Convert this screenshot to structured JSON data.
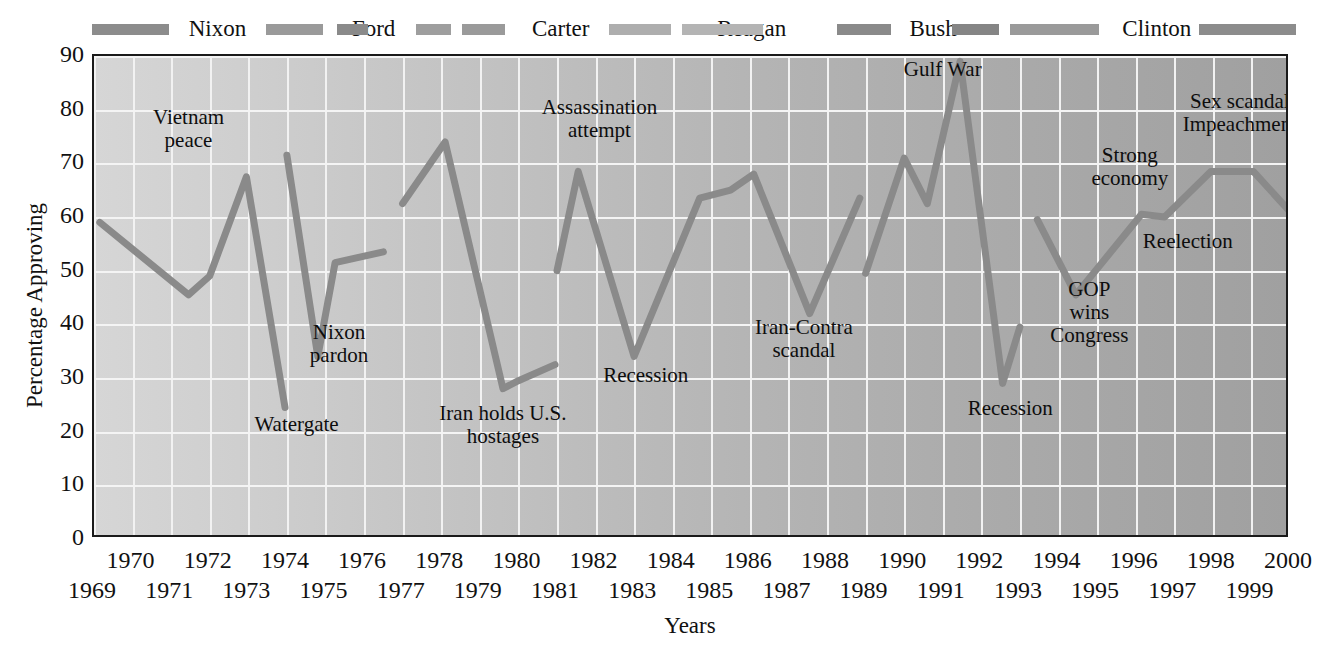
{
  "chart_data": {
    "type": "line",
    "title": "",
    "xlabel": "Years",
    "ylabel": "Percentage Approving",
    "ylim": [
      0,
      90
    ],
    "ytick_step": 10,
    "yticks": [
      "0",
      "10",
      "20",
      "30",
      "40",
      "50",
      "60",
      "70",
      "80",
      "90"
    ],
    "xlim": [
      1969,
      2000
    ],
    "grid": true,
    "legend_position": "top",
    "xticks_upper": [
      "1970",
      "1972",
      "1974",
      "1976",
      "1978",
      "1980",
      "1982",
      "1984",
      "1986",
      "1988",
      "1990",
      "1992",
      "1994",
      "1996",
      "1998",
      "2000"
    ],
    "xticks_lower": [
      "1969",
      "1971",
      "1973",
      "1975",
      "1977",
      "1979",
      "1981",
      "1983",
      "1985",
      "1987",
      "1989",
      "1991",
      "1993",
      "1995",
      "1997",
      "1999"
    ],
    "line_color": "#8a8a8a",
    "series": [
      {
        "name": "Nixon",
        "points": [
          {
            "x": 1969.15,
            "y": 59
          },
          {
            "x": 1971.45,
            "y": 45.5
          },
          {
            "x": 1972.0,
            "y": 49
          },
          {
            "x": 1972.95,
            "y": 67.5
          },
          {
            "x": 1973.95,
            "y": 24.5
          }
        ]
      },
      {
        "name": "Ford",
        "points": [
          {
            "x": 1974.0,
            "y": 71.5
          },
          {
            "x": 1974.8,
            "y": 34
          },
          {
            "x": 1975.25,
            "y": 51.5
          },
          {
            "x": 1976.5,
            "y": 53.5
          }
        ]
      },
      {
        "name": "Carter",
        "points": [
          {
            "x": 1977.0,
            "y": 62.5
          },
          {
            "x": 1978.1,
            "y": 74
          },
          {
            "x": 1979.6,
            "y": 28
          },
          {
            "x": 1980.0,
            "y": 29.5
          },
          {
            "x": 1980.95,
            "y": 32.5
          }
        ]
      },
      {
        "name": "Reagan",
        "points": [
          {
            "x": 1981.0,
            "y": 50
          },
          {
            "x": 1981.55,
            "y": 68.5
          },
          {
            "x": 1983.0,
            "y": 34
          },
          {
            "x": 1984.7,
            "y": 63.5
          },
          {
            "x": 1985.5,
            "y": 65
          },
          {
            "x": 1986.1,
            "y": 68
          },
          {
            "x": 1987.55,
            "y": 42
          },
          {
            "x": 1988.85,
            "y": 63.5
          }
        ]
      },
      {
        "name": "Bush",
        "points": [
          {
            "x": 1989.0,
            "y": 49.5
          },
          {
            "x": 1990.0,
            "y": 71
          },
          {
            "x": 1990.6,
            "y": 62.5
          },
          {
            "x": 1991.45,
            "y": 89
          },
          {
            "x": 1992.55,
            "y": 29
          },
          {
            "x": 1993.0,
            "y": 39.5
          }
        ]
      },
      {
        "name": "Clinton",
        "points": [
          {
            "x": 1993.45,
            "y": 59.5
          },
          {
            "x": 1994.45,
            "y": 45.5
          },
          {
            "x": 1996.15,
            "y": 60.5
          },
          {
            "x": 1996.75,
            "y": 60
          },
          {
            "x": 1997.95,
            "y": 68.5
          },
          {
            "x": 1999.05,
            "y": 68.5
          },
          {
            "x": 2000.0,
            "y": 61
          }
        ]
      }
    ],
    "annotations": [
      {
        "text": "Vietnam\npeace",
        "x": 1971.45,
        "y": 76.5
      },
      {
        "text": "Watergate",
        "x": 1974.25,
        "y": 21.5
      },
      {
        "text": "Nixon\npardon",
        "x": 1975.35,
        "y": 36.5
      },
      {
        "text": "Iran holds U.S.\nhostages",
        "x": 1979.6,
        "y": 21.5
      },
      {
        "text": "Assassination\nattempt",
        "x": 1982.1,
        "y": 78.5
      },
      {
        "text": "Recession",
        "x": 1983.3,
        "y": 30.5
      },
      {
        "text": "Iran-Contra\nscandal",
        "x": 1987.4,
        "y": 37.5
      },
      {
        "text": "Gulf War",
        "x": 1991.0,
        "y": 87.5
      },
      {
        "text": "Recession",
        "x": 1992.75,
        "y": 24.5
      },
      {
        "text": "GOP\nwins\nCongress",
        "x": 1994.8,
        "y": 42.5
      },
      {
        "text": "Strong\neconomy",
        "x": 1995.85,
        "y": 69.5
      },
      {
        "text": "Reelection",
        "x": 1997.35,
        "y": 55.5
      },
      {
        "text": "Sex scandal\nImpeachment",
        "x": 1998.7,
        "y": 79.5
      }
    ],
    "legend_segments": [
      {
        "label": "Nixon",
        "bar_start": 1969.0,
        "bar_end": 1971.0,
        "label_x": 1972.25,
        "color": "#8c8c8c"
      },
      {
        "label": "Ford",
        "bar_start": 1973.5,
        "bar_end": 1975.0,
        "label_x": 1976.3,
        "color": "#9a9a9a"
      },
      {
        "label": "Ford2",
        "bar_start": 1975.35,
        "bar_end": 1976.15,
        "label_x": null,
        "color": "#8a8a8a"
      },
      {
        "label": "Carter",
        "bar_start": 1977.4,
        "bar_end": 1978.3,
        "label_x": 1981.15,
        "color": "#9e9e9e"
      },
      {
        "label": "Carter2",
        "bar_start": 1978.6,
        "bar_end": 1979.7,
        "label_x": null,
        "color": "#9a9a9a"
      },
      {
        "label": "Reagan",
        "bar_start": 1982.4,
        "bar_end": 1984.0,
        "label_x": 1986.1,
        "color": "#aeaeae"
      },
      {
        "label": "Reagan2",
        "bar_start": 1984.3,
        "bar_end": 1986.4,
        "label_x": null,
        "color": "#b4b4b4"
      },
      {
        "label": "Bush",
        "bar_start": 1988.3,
        "bar_end": 1989.7,
        "label_x": 1990.8,
        "color": "#8a8a8a"
      },
      {
        "label": "Bush2",
        "bar_start": 1991.3,
        "bar_end": 1992.5,
        "label_x": null,
        "color": "#858585"
      },
      {
        "label": "Clinton",
        "bar_start": 1992.8,
        "bar_end": 1995.1,
        "label_x": 1996.6,
        "color": "#9a9a9a"
      },
      {
        "label": "Clinton2",
        "bar_start": 1997.7,
        "bar_end": 2000.2,
        "label_x": null,
        "color": "#8c8c8c"
      }
    ]
  }
}
